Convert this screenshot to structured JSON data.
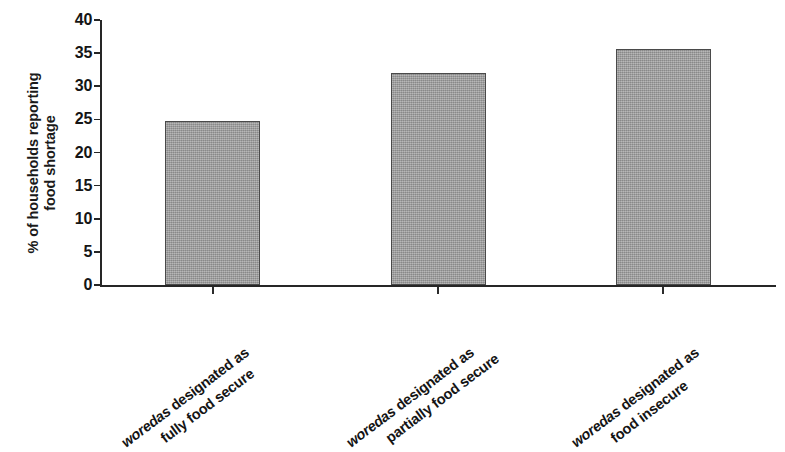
{
  "chart_data": {
    "type": "bar",
    "title": "",
    "subtitle": "",
    "xlabel": "",
    "ylabel": "% of households reporting food shortage",
    "ylabel_lines": [
      "% of households reporting",
      "food shortage"
    ],
    "ylim": [
      0,
      40
    ],
    "ytick_values": [
      0,
      5,
      10,
      15,
      20,
      25,
      30,
      35,
      40
    ],
    "ytick_labels": [
      "0",
      "5",
      "10",
      "15",
      "20",
      "25",
      "30",
      "35",
      "40"
    ],
    "grid": false,
    "legend": null,
    "categories": [
      "woredas designated as fully food secure",
      "woredas designated as partially food secure",
      "woredas designated as food insecure"
    ],
    "category_lines": [
      {
        "emphasis": "woredas",
        "line1_rest": " designated as",
        "line2": "fully food secure"
      },
      {
        "emphasis": "woredas",
        "line1_rest": " designated as",
        "line2": "partially food secure"
      },
      {
        "emphasis": "woredas",
        "line1_rest": " designated as",
        "line2": "food insecure"
      }
    ],
    "values": [
      24.8,
      32.0,
      35.6
    ],
    "bar_color": "#9c9c9c",
    "bar_edge_color": "#4a4a4a",
    "axis_color": "#262626",
    "background_color": "#ffffff"
  }
}
